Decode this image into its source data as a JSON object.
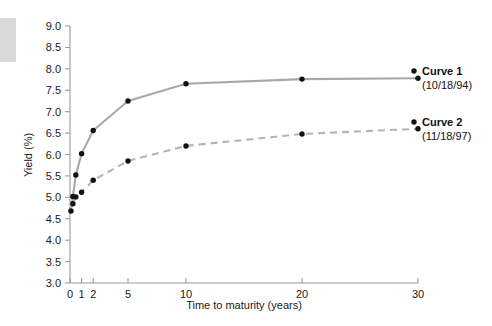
{
  "chart_data": {
    "type": "line",
    "title": "",
    "xlabel": "Time to maturity (years)",
    "ylabel": "Yield (%)",
    "xlim": [
      0,
      30
    ],
    "ylim": [
      3.0,
      9.0
    ],
    "xticks": [
      0,
      1,
      2,
      5,
      10,
      20,
      30
    ],
    "xtick_labels": [
      "0",
      "1",
      "2",
      "5",
      "10",
      "20",
      "30"
    ],
    "yticks": [
      3.0,
      3.5,
      4.0,
      4.5,
      5.0,
      5.5,
      6.0,
      6.5,
      7.0,
      7.5,
      8.0,
      8.5,
      9.0
    ],
    "ytick_labels": [
      "3.0",
      "3.5",
      "4.0",
      "4.5",
      "5.0",
      "5.5",
      "6.0",
      "6.5",
      "7.0",
      "7.5",
      "8.0",
      "8.5",
      "9.0"
    ],
    "grid": false,
    "legend_position": "right",
    "series": [
      {
        "name": "Curve 1",
        "sublabel": "(10/18/94)",
        "linestyle": "solid",
        "color": "#a8a8a8",
        "marker_color": "#111111",
        "x": [
          0.08,
          0.25,
          0.5,
          1,
          2,
          5,
          10,
          20,
          30
        ],
        "y": [
          4.68,
          5.02,
          5.52,
          6.02,
          6.56,
          7.25,
          7.65,
          7.76,
          7.78
        ]
      },
      {
        "name": "Curve 2",
        "sublabel": "(11/18/97)",
        "linestyle": "dashed",
        "color": "#b4b4b4",
        "marker_color": "#111111",
        "x": [
          0.25,
          0.5,
          1,
          2,
          5,
          10,
          20,
          30
        ],
        "y": [
          4.85,
          5.01,
          5.12,
          5.4,
          5.85,
          6.2,
          6.48,
          6.6
        ]
      }
    ]
  },
  "axes": {
    "xlabel": "Time to maturity (years)",
    "ylabel": "Yield (%)"
  },
  "legend": {
    "entries": [
      {
        "label": "Curve 1",
        "sublabel": "(10/18/94)"
      },
      {
        "label": "Curve 2",
        "sublabel": "(11/18/97)"
      }
    ]
  }
}
